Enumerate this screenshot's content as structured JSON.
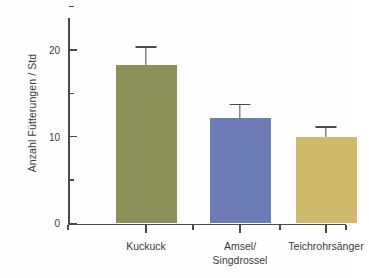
{
  "chart_data": {
    "type": "bar",
    "title": "",
    "xlabel": "",
    "ylabel": "Anzahl Fütterungen / Std",
    "ylim": [
      0,
      26
    ],
    "grid": false,
    "legend": false,
    "categories": [
      "Kuckuck",
      "Amsel/ Singdrossel",
      "Teichrohrsänger"
    ],
    "values": [
      18.3,
      12.2,
      10.0
    ],
    "errors": [
      2.1,
      1.6,
      1.2
    ],
    "series": [
      {
        "name": "Anzahl Fütterungen / Std",
        "values": [
          18.3,
          12.2,
          10.0
        ],
        "errors": [
          2.1,
          1.6,
          1.2
        ]
      }
    ],
    "bars": [
      {
        "category_line1": "Kuckuck",
        "category_line2": "",
        "value": 18.3,
        "error": 2.1,
        "error_top": 20.4,
        "color": "#8b9159"
      },
      {
        "category_line1": "Amsel/",
        "category_line2": "Singdrossel",
        "value": 12.2,
        "error": 1.6,
        "error_top": 13.8,
        "color": "#6c7cb5"
      },
      {
        "category_line1": "Teichrohrsänger",
        "category_line2": "",
        "value": 10.0,
        "error": 1.2,
        "error_top": 11.2,
        "color": "#cfbb6b"
      }
    ],
    "y_ticks_major": [
      0,
      10,
      20
    ],
    "y_ticks_major_labels": [
      "0",
      "10",
      "20"
    ],
    "y_ticks_minor": [
      5,
      15,
      25
    ],
    "axis_color": "#4a4a4a",
    "text_color": "#3a3a3a",
    "background_color": "#fefefe"
  }
}
